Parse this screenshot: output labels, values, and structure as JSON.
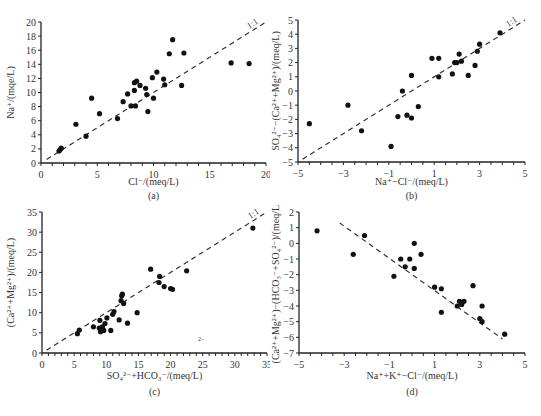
{
  "chart_data": [
    {
      "id": "a",
      "type": "scatter",
      "panel_label": "(a)",
      "xlabel": "Cl⁻/(meq/L)",
      "ylabel": "Na⁺/(mqe/L)",
      "xlim": [
        0,
        20
      ],
      "ylim": [
        0,
        20
      ],
      "xticks": [
        0,
        5,
        10,
        15,
        20
      ],
      "yticks": [
        0,
        2,
        4,
        6,
        8,
        10,
        12,
        14,
        16,
        18,
        20
      ],
      "reference_line": {
        "label": "1:1",
        "from": [
          0.5,
          0.5
        ],
        "to": [
          20,
          20
        ],
        "style": "dashed"
      },
      "grid": false,
      "points": [
        [
          1.6,
          1.7
        ],
        [
          1.7,
          1.9
        ],
        [
          1.8,
          2.1
        ],
        [
          3.1,
          5.5
        ],
        [
          4.0,
          3.8
        ],
        [
          4.5,
          9.2
        ],
        [
          5.2,
          7.0
        ],
        [
          6.8,
          6.3
        ],
        [
          7.3,
          8.7
        ],
        [
          7.7,
          9.8
        ],
        [
          8.0,
          8.1
        ],
        [
          8.3,
          10.3
        ],
        [
          8.3,
          11.4
        ],
        [
          8.5,
          11.6
        ],
        [
          8.4,
          8.1
        ],
        [
          8.8,
          11.0
        ],
        [
          9.3,
          10.6
        ],
        [
          9.4,
          9.7
        ],
        [
          9.5,
          7.3
        ],
        [
          9.9,
          12.1
        ],
        [
          10.0,
          9.2
        ],
        [
          10.3,
          12.9
        ],
        [
          10.9,
          11.9
        ],
        [
          11.0,
          11.1
        ],
        [
          11.4,
          15.5
        ],
        [
          11.7,
          17.5
        ],
        [
          12.5,
          11.0
        ],
        [
          12.7,
          15.6
        ],
        [
          16.9,
          14.2
        ],
        [
          18.5,
          14.1
        ]
      ]
    },
    {
      "id": "b",
      "type": "scatter",
      "panel_label": "(b)",
      "xlabel": "Na⁺−Cl⁻/(meq/L)",
      "ylabel": "SO₄²⁻−(Ca²⁺+Mg²⁺)/(meq/L)",
      "xlim": [
        -5,
        5
      ],
      "ylim": [
        -5,
        5
      ],
      "xticks": [
        -5,
        -3,
        -1,
        1,
        3,
        5
      ],
      "yticks": [
        -5,
        -4,
        -3,
        -2,
        -1,
        0,
        1,
        2,
        3,
        4,
        5
      ],
      "reference_line": {
        "label": "1:1",
        "from": [
          -4.8,
          -4.8
        ],
        "to": [
          5,
          5
        ],
        "style": "dashed"
      },
      "grid": false,
      "points": [
        [
          -4.5,
          -2.3
        ],
        [
          -2.8,
          -1.0
        ],
        [
          -2.2,
          -2.8
        ],
        [
          -0.9,
          -3.9
        ],
        [
          -0.6,
          -1.8
        ],
        [
          -0.4,
          0.0
        ],
        [
          -0.2,
          -1.7
        ],
        [
          0.0,
          1.1
        ],
        [
          0.0,
          -1.9
        ],
        [
          0.3,
          -1.1
        ],
        [
          0.9,
          2.3
        ],
        [
          1.2,
          2.3
        ],
        [
          1.2,
          1.0
        ],
        [
          1.8,
          1.2
        ],
        [
          1.9,
          2.0
        ],
        [
          2.0,
          2.0
        ],
        [
          2.1,
          2.6
        ],
        [
          2.2,
          2.1
        ],
        [
          2.5,
          1.1
        ],
        [
          2.8,
          1.8
        ],
        [
          2.9,
          2.8
        ],
        [
          3.0,
          3.3
        ],
        [
          3.9,
          4.1
        ]
      ]
    },
    {
      "id": "c",
      "type": "scatter",
      "panel_label": "(c)",
      "xlabel": "SO₄²⁻+HCO₃⁻/(meq/L)",
      "ylabel": "(Ca²⁺+Mg²⁺)/(meq/L)",
      "xlim": [
        0,
        35
      ],
      "ylim": [
        0,
        35
      ],
      "xticks": [
        0,
        5,
        10,
        15,
        20,
        25,
        30,
        35
      ],
      "yticks": [
        0,
        5,
        10,
        15,
        20,
        25,
        30,
        35
      ],
      "reference_line": {
        "label": "1:1",
        "from": [
          0.7,
          0.7
        ],
        "to": [
          35,
          35
        ],
        "style": "dashed"
      },
      "grid": false,
      "points": [
        [
          5.5,
          4.8
        ],
        [
          5.8,
          5.7
        ],
        [
          8.0,
          6.5
        ],
        [
          9.0,
          8.1
        ],
        [
          8.9,
          6.2
        ],
        [
          9.1,
          5.3
        ],
        [
          9.2,
          6.0
        ],
        [
          9.4,
          6.5
        ],
        [
          9.6,
          5.6
        ],
        [
          9.8,
          7.3
        ],
        [
          10.1,
          8.7
        ],
        [
          10.7,
          5.6
        ],
        [
          11.0,
          9.6
        ],
        [
          11.2,
          10.3
        ],
        [
          12.0,
          8.2
        ],
        [
          12.3,
          13.0
        ],
        [
          12.4,
          14.2
        ],
        [
          12.5,
          14.6
        ],
        [
          12.7,
          12.3
        ],
        [
          13.3,
          7.4
        ],
        [
          14.8,
          10.0
        ],
        [
          16.9,
          20.8
        ],
        [
          18.2,
          17.5
        ],
        [
          18.3,
          19.0
        ],
        [
          19.0,
          16.5
        ],
        [
          20.0,
          16.0
        ],
        [
          20.3,
          15.8
        ],
        [
          22.5,
          20.4
        ],
        [
          32.8,
          31.0
        ]
      ]
    },
    {
      "id": "d",
      "type": "scatter",
      "panel_label": "(d)",
      "xlabel": "Na⁺+K⁺−Cl⁻/(meq/L)",
      "ylabel": "(Ca²⁺+Mg²⁺)−(HCO₃⁻+SO₄²⁻)/(meq/L)",
      "xlim": [
        -5,
        5
      ],
      "ylim": [
        -7,
        2
      ],
      "xticks": [
        -5,
        -3,
        -1,
        1,
        3,
        5
      ],
      "yticks": [
        -7,
        -6,
        -5,
        -4,
        -3,
        -2,
        -1,
        0,
        1,
        2
      ],
      "reference_line": {
        "label": "",
        "from": [
          -3.2,
          1.3
        ],
        "to": [
          4.0,
          -6.1
        ],
        "style": "dashed"
      },
      "grid": false,
      "points": [
        [
          -4.2,
          0.8
        ],
        [
          -2.6,
          -0.7
        ],
        [
          -2.1,
          0.5
        ],
        [
          -0.8,
          -2.1
        ],
        [
          -0.5,
          -1.0
        ],
        [
          -0.3,
          -1.5
        ],
        [
          -0.1,
          -1.0
        ],
        [
          0.1,
          0.0
        ],
        [
          0.1,
          -1.6
        ],
        [
          0.4,
          -0.7
        ],
        [
          1.0,
          -2.8
        ],
        [
          1.3,
          -2.9
        ],
        [
          1.3,
          -4.4
        ],
        [
          2.0,
          -4.0
        ],
        [
          2.1,
          -3.7
        ],
        [
          2.2,
          -3.9
        ],
        [
          2.3,
          -3.7
        ],
        [
          2.7,
          -2.7
        ],
        [
          3.0,
          -4.8
        ],
        [
          3.1,
          -4.0
        ],
        [
          3.1,
          -5.0
        ],
        [
          4.1,
          -5.8
        ]
      ]
    }
  ],
  "stray_marks": {
    "c": "2−"
  }
}
